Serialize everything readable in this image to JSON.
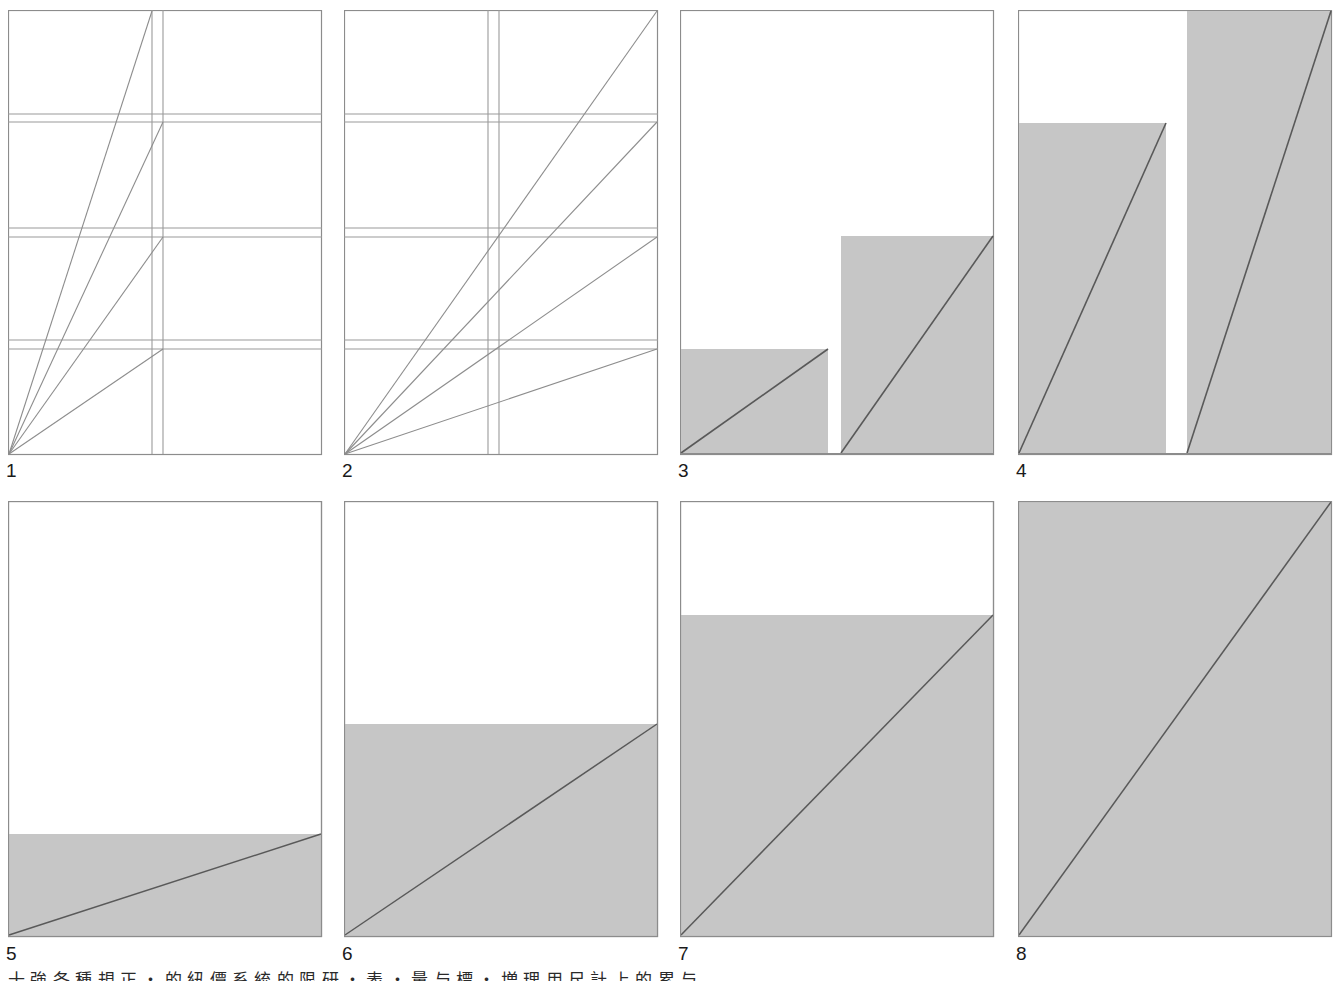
{
  "figure": {
    "title_caption": "十 強 各 種 規 正 ・ 的 紐 價 系 統 的 限 研 ・ 表 ・ 量 与 標 ・ 増 理 用 尺 計 上 的 累 与",
    "caption_visible": "partially cropped bottom text line",
    "colors": {
      "fill_gray": "#c6c6c6",
      "line_dark": "#595959",
      "border": "#8c8c8c",
      "background": "#ffffff",
      "label_text": "#1a1a1a"
    },
    "panel_count": 8,
    "grid": {
      "rows": 2,
      "cols": 4
    }
  },
  "panels": [
    {
      "label": "1",
      "kind": "grid-with-fan-lines",
      "description": "Outlined rectangle with three horizontal double rules and one vertical double rule; four rays fan out from the bottom-left corner crossing the vertical rule.",
      "frame": {
        "x": 8,
        "y": 10,
        "w": 314,
        "h": 444
      },
      "horizontal_rules_y": [
        114,
        122,
        228,
        237,
        340,
        349
      ],
      "vertical_rules_x": [
        152,
        163
      ],
      "rays_from": "bottom-left",
      "ray_endpoints": [
        {
          "x": 152,
          "y": 10
        },
        {
          "x": 163,
          "y": 122
        },
        {
          "x": 163,
          "y": 237
        },
        {
          "x": 163,
          "y": 349
        }
      ]
    },
    {
      "label": "2",
      "kind": "grid-with-fan-lines",
      "description": "Same grid as panel 1 but the four rays extend all the way to the right-hand edge, meeting it at the top corner and at each horizontal rule.",
      "frame": {
        "x": 344,
        "y": 10,
        "w": 314,
        "h": 444
      },
      "horizontal_rules_y": [
        114,
        122,
        228,
        237,
        340,
        349
      ],
      "vertical_rules_x": [
        488,
        499
      ],
      "rays_from": "bottom-left",
      "ray_endpoints": [
        {
          "x": 658,
          "y": 10
        },
        {
          "x": 658,
          "y": 122
        },
        {
          "x": 658,
          "y": 237
        },
        {
          "x": 658,
          "y": 349
        }
      ]
    },
    {
      "label": "3",
      "kind": "two-bars",
      "description": "Two gray bars rising from the baseline; a short bar on the left and a taller bar on the right, each crossed by a diagonal from its bottom-left to its top-right.",
      "frame": {
        "x": 680,
        "y": 10,
        "w": 314,
        "h": 444
      },
      "bars": [
        {
          "x": 681,
          "y": 349,
          "w": 147,
          "h": 104,
          "diagonal": "bottom-left to top-right"
        },
        {
          "x": 841,
          "y": 236,
          "w": 152,
          "h": 217,
          "diagonal": "bottom-left to top-right"
        }
      ]
    },
    {
      "label": "4",
      "kind": "two-bars",
      "description": "Two tall gray bars; the left bar tops out partway up, the right bar reaches the top of the frame. Each is crossed by a steep diagonal.",
      "frame": {
        "x": 1018,
        "y": 10,
        "w": 314,
        "h": 444
      },
      "bars": [
        {
          "x": 1019,
          "y": 123,
          "w": 147,
          "h": 330,
          "diagonal": "bottom-left to top-right"
        },
        {
          "x": 1188,
          "y": 11,
          "w": 144,
          "h": 442,
          "diagonal": "bottom-left to top-right"
        }
      ]
    },
    {
      "label": "5",
      "kind": "fill-band",
      "description": "Frame with a shallow gray band across the bottom; a shallow diagonal runs from the bottom-left corner up to the right edge at the top of the band.",
      "frame": {
        "x": 8,
        "y": 501,
        "w": 314,
        "h": 435
      },
      "fill_top_y": 834,
      "fill_fraction": 0.235,
      "diagonal": {
        "from": [
          9,
          935
        ],
        "to": [
          321,
          834
        ]
      }
    },
    {
      "label": "6",
      "kind": "fill-band",
      "description": "Frame with gray filling the lower half; a diagonal runs from the bottom-left corner up to the right edge at the top of the fill.",
      "frame": {
        "x": 344,
        "y": 501,
        "w": 314,
        "h": 435
      },
      "fill_top_y": 724,
      "fill_fraction": 0.487,
      "diagonal": {
        "from": [
          345,
          935
        ],
        "to": [
          657,
          724
        ]
      }
    },
    {
      "label": "7",
      "kind": "fill-band",
      "description": "Frame with gray filling roughly three quarters of the height; a diagonal runs from the bottom-left corner up to the right edge at the top of the fill.",
      "frame": {
        "x": 680,
        "y": 501,
        "w": 314,
        "h": 435
      },
      "fill_top_y": 615,
      "fill_fraction": 0.738,
      "diagonal": {
        "from": [
          681,
          935
        ],
        "to": [
          993,
          615
        ]
      }
    },
    {
      "label": "8",
      "kind": "fill-band",
      "description": "Frame filled entirely with gray; a diagonal runs from the bottom-left corner to the top-right corner.",
      "frame": {
        "x": 1018,
        "y": 501,
        "w": 314,
        "h": 435
      },
      "fill_top_y": 502,
      "fill_fraction": 1.0,
      "diagonal": {
        "from": [
          1019,
          935
        ],
        "to": [
          1331,
          502
        ]
      }
    }
  ],
  "labels": {
    "p1": "1",
    "p2": "2",
    "p3": "3",
    "p4": "4",
    "p5": "5",
    "p6": "6",
    "p7": "7",
    "p8": "8"
  }
}
